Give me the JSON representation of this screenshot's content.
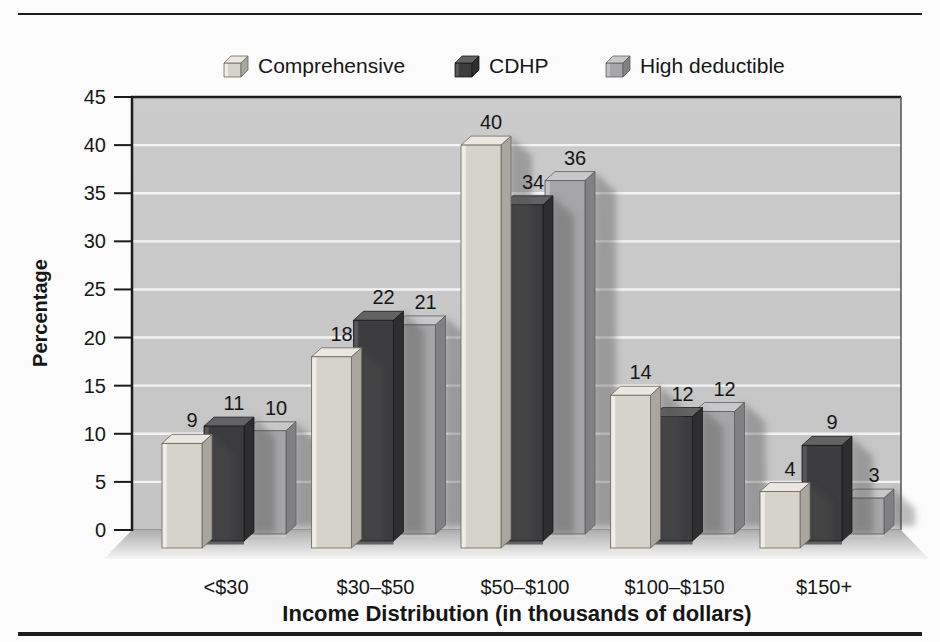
{
  "page": {
    "background": "#fcfcfc"
  },
  "chart_data": {
    "type": "bar",
    "style": "3d-grouped-column",
    "title": "",
    "categories": [
      "<$30",
      "$30–$50",
      "$50–$100",
      "$100–$150",
      "$150+"
    ],
    "series": [
      {
        "name": "Comprehensive",
        "values": [
          9,
          18,
          40,
          14,
          4
        ],
        "colors": {
          "front": "#d6d3cb",
          "top": "#e9e7e0",
          "side": "#a9a69f",
          "bevel": "#efede7",
          "edge": "#6b6760"
        }
      },
      {
        "name": "CDHP",
        "values": [
          11,
          22,
          34,
          12,
          9
        ],
        "colors": {
          "front": "#3c3c3e",
          "top": "#636365",
          "side": "#2e2e30",
          "bevel": "#57575a",
          "edge": "#1a1a1c"
        }
      },
      {
        "name": "High deductible",
        "values": [
          10,
          21,
          36,
          12,
          3
        ],
        "colors": {
          "front": "#a6a6a8",
          "top": "#c8c8ca",
          "side": "#818183",
          "bevel": "#c2c2c4",
          "edge": "#5d5d5f"
        }
      }
    ],
    "xlabel": "Income Distribution (in thousands of dollars)",
    "ylabel": "Percentage",
    "ylim": [
      0,
      45
    ],
    "yticks": [
      0,
      5,
      10,
      15,
      20,
      25,
      30,
      35,
      40,
      45
    ],
    "grid": true,
    "legend_position": "top",
    "data_labels": true
  },
  "colors": {
    "wall": "#cbcbcb",
    "wall_bottom": "#c5c5c5",
    "gridline": "#f3f3f3",
    "axis": "#1c1c1c",
    "wall_right_edge": "#555555",
    "wall_base_edge": "#8a8a8a",
    "floor_top": "#aeaeae",
    "floor_bottom": "#f5f5f5",
    "shadow": "rgba(80,80,80,0.38)",
    "text": "#161616"
  }
}
